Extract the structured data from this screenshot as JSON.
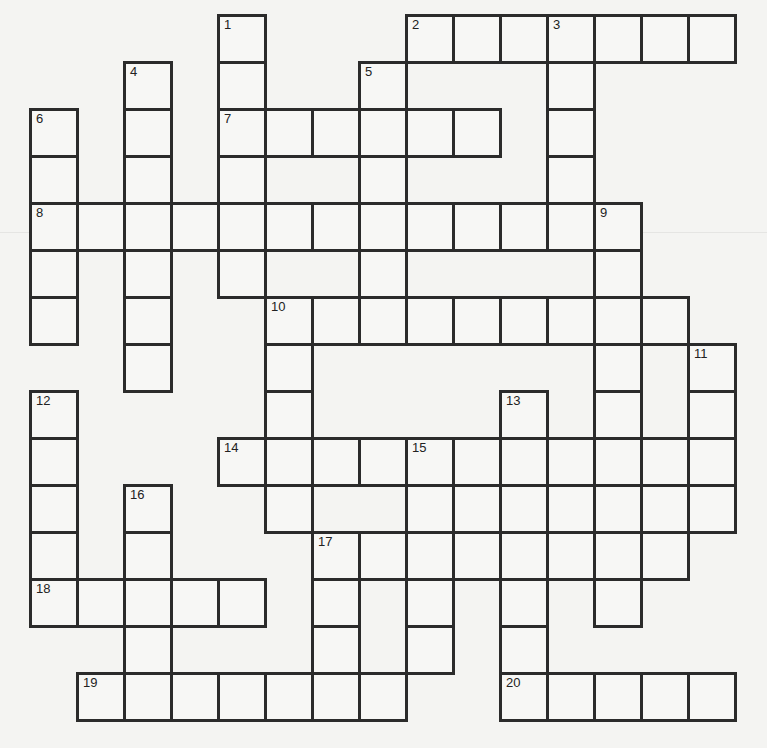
{
  "puzzle": {
    "type": "crossword",
    "origin_x": 30,
    "origin_y": 15,
    "cell_size": 47,
    "rows": 15,
    "cols": 15,
    "border_color": "#2b2b2b",
    "background_color": "#f4f4f2",
    "cells": [
      {
        "r": 0,
        "c": 4,
        "n": "1"
      },
      {
        "r": 0,
        "c": 8,
        "n": "2"
      },
      {
        "r": 0,
        "c": 9
      },
      {
        "r": 0,
        "c": 10
      },
      {
        "r": 0,
        "c": 11,
        "n": "3"
      },
      {
        "r": 0,
        "c": 12
      },
      {
        "r": 0,
        "c": 13
      },
      {
        "r": 0,
        "c": 14
      },
      {
        "r": 1,
        "c": 2,
        "n": "4"
      },
      {
        "r": 1,
        "c": 4
      },
      {
        "r": 1,
        "c": 7,
        "n": "5"
      },
      {
        "r": 1,
        "c": 11
      },
      {
        "r": 2,
        "c": 0,
        "n": "6"
      },
      {
        "r": 2,
        "c": 2
      },
      {
        "r": 2,
        "c": 4,
        "n": "7"
      },
      {
        "r": 2,
        "c": 5
      },
      {
        "r": 2,
        "c": 6
      },
      {
        "r": 2,
        "c": 7
      },
      {
        "r": 2,
        "c": 8
      },
      {
        "r": 2,
        "c": 9
      },
      {
        "r": 2,
        "c": 11
      },
      {
        "r": 3,
        "c": 0
      },
      {
        "r": 3,
        "c": 2
      },
      {
        "r": 3,
        "c": 4
      },
      {
        "r": 3,
        "c": 7
      },
      {
        "r": 3,
        "c": 11
      },
      {
        "r": 4,
        "c": 0,
        "n": "8"
      },
      {
        "r": 4,
        "c": 1
      },
      {
        "r": 4,
        "c": 2
      },
      {
        "r": 4,
        "c": 3
      },
      {
        "r": 4,
        "c": 4
      },
      {
        "r": 4,
        "c": 5
      },
      {
        "r": 4,
        "c": 6
      },
      {
        "r": 4,
        "c": 7
      },
      {
        "r": 4,
        "c": 8
      },
      {
        "r": 4,
        "c": 9
      },
      {
        "r": 4,
        "c": 10
      },
      {
        "r": 4,
        "c": 11
      },
      {
        "r": 4,
        "c": 12,
        "n": "9"
      },
      {
        "r": 5,
        "c": 0
      },
      {
        "r": 5,
        "c": 2
      },
      {
        "r": 5,
        "c": 4
      },
      {
        "r": 5,
        "c": 7
      },
      {
        "r": 5,
        "c": 12
      },
      {
        "r": 6,
        "c": 0
      },
      {
        "r": 6,
        "c": 2
      },
      {
        "r": 6,
        "c": 5,
        "n": "10"
      },
      {
        "r": 6,
        "c": 6
      },
      {
        "r": 6,
        "c": 7
      },
      {
        "r": 6,
        "c": 8
      },
      {
        "r": 6,
        "c": 9
      },
      {
        "r": 6,
        "c": 10
      },
      {
        "r": 6,
        "c": 11
      },
      {
        "r": 6,
        "c": 12
      },
      {
        "r": 6,
        "c": 13
      },
      {
        "r": 7,
        "c": 2
      },
      {
        "r": 7,
        "c": 5
      },
      {
        "r": 7,
        "c": 12
      },
      {
        "r": 7,
        "c": 14,
        "n": "11"
      },
      {
        "r": 8,
        "c": 0,
        "n": "12"
      },
      {
        "r": 8,
        "c": 5
      },
      {
        "r": 8,
        "c": 10,
        "n": "13"
      },
      {
        "r": 8,
        "c": 12
      },
      {
        "r": 8,
        "c": 14
      },
      {
        "r": 9,
        "c": 0
      },
      {
        "r": 9,
        "c": 4,
        "n": "14"
      },
      {
        "r": 9,
        "c": 5
      },
      {
        "r": 9,
        "c": 6
      },
      {
        "r": 9,
        "c": 7
      },
      {
        "r": 9,
        "c": 8,
        "n": "15"
      },
      {
        "r": 9,
        "c": 9
      },
      {
        "r": 9,
        "c": 10
      },
      {
        "r": 9,
        "c": 11
      },
      {
        "r": 9,
        "c": 12
      },
      {
        "r": 9,
        "c": 13
      },
      {
        "r": 9,
        "c": 14
      },
      {
        "r": 10,
        "c": 0
      },
      {
        "r": 10,
        "c": 2,
        "n": "16"
      },
      {
        "r": 10,
        "c": 5
      },
      {
        "r": 10,
        "c": 8
      },
      {
        "r": 10,
        "c": 9
      },
      {
        "r": 10,
        "c": 10
      },
      {
        "r": 10,
        "c": 11
      },
      {
        "r": 10,
        "c": 12
      },
      {
        "r": 10,
        "c": 13
      },
      {
        "r": 10,
        "c": 14
      },
      {
        "r": 11,
        "c": 0
      },
      {
        "r": 11,
        "c": 2
      },
      {
        "r": 11,
        "c": 6,
        "n": "17"
      },
      {
        "r": 11,
        "c": 7
      },
      {
        "r": 11,
        "c": 8
      },
      {
        "r": 11,
        "c": 9
      },
      {
        "r": 11,
        "c": 10
      },
      {
        "r": 11,
        "c": 11
      },
      {
        "r": 11,
        "c": 12
      },
      {
        "r": 11,
        "c": 13
      },
      {
        "r": 12,
        "c": 0,
        "n": "18"
      },
      {
        "r": 12,
        "c": 1
      },
      {
        "r": 12,
        "c": 2
      },
      {
        "r": 12,
        "c": 3
      },
      {
        "r": 12,
        "c": 4
      },
      {
        "r": 12,
        "c": 6
      },
      {
        "r": 12,
        "c": 8
      },
      {
        "r": 12,
        "c": 10
      },
      {
        "r": 12,
        "c": 12
      },
      {
        "r": 13,
        "c": 2
      },
      {
        "r": 13,
        "c": 6
      },
      {
        "r": 13,
        "c": 8
      },
      {
        "r": 13,
        "c": 10
      },
      {
        "r": 14,
        "c": 1,
        "n": "19"
      },
      {
        "r": 14,
        "c": 2
      },
      {
        "r": 14,
        "c": 3
      },
      {
        "r": 14,
        "c": 4
      },
      {
        "r": 14,
        "c": 5
      },
      {
        "r": 14,
        "c": 6
      },
      {
        "r": 14,
        "c": 7
      },
      {
        "r": 14,
        "c": 10,
        "n": "20"
      },
      {
        "r": 14,
        "c": 11
      },
      {
        "r": 14,
        "c": 12
      },
      {
        "r": 14,
        "c": 13
      },
      {
        "r": 14,
        "c": 14
      }
    ],
    "entries": {
      "across": [
        {
          "number": "2",
          "row": 0,
          "col": 8,
          "length": 7
        },
        {
          "number": "7",
          "row": 2,
          "col": 4,
          "length": 6
        },
        {
          "number": "8",
          "row": 4,
          "col": 0,
          "length": 13
        },
        {
          "number": "10",
          "row": 6,
          "col": 5,
          "length": 9
        },
        {
          "number": "14",
          "row": 9,
          "col": 4,
          "length": 11
        },
        {
          "number": "17",
          "row": 11,
          "col": 6,
          "length": 8
        },
        {
          "number": "18",
          "row": 12,
          "col": 0,
          "length": 5
        },
        {
          "number": "19",
          "row": 14,
          "col": 1,
          "length": 7
        },
        {
          "number": "20",
          "row": 14,
          "col": 10,
          "length": 5
        }
      ],
      "down": [
        {
          "number": "1",
          "row": 0,
          "col": 4,
          "length": 6
        },
        {
          "number": "3",
          "row": 0,
          "col": 11,
          "length": 5
        },
        {
          "number": "4",
          "row": 1,
          "col": 2,
          "length": 7
        },
        {
          "number": "5",
          "row": 1,
          "col": 7,
          "length": 6
        },
        {
          "number": "6",
          "row": 2,
          "col": 0,
          "length": 5
        },
        {
          "number": "9",
          "row": 4,
          "col": 12,
          "length": 9
        },
        {
          "number": "11",
          "row": 7,
          "col": 14,
          "length": 4
        },
        {
          "number": "12",
          "row": 8,
          "col": 0,
          "length": 5
        },
        {
          "number": "13",
          "row": 8,
          "col": 10,
          "length": 7
        },
        {
          "number": "15",
          "row": 9,
          "col": 8,
          "length": 5
        },
        {
          "number": "16",
          "row": 10,
          "col": 2,
          "length": 5
        },
        {
          "number": "17",
          "row": 11,
          "col": 6,
          "length": 4
        }
      ]
    }
  }
}
